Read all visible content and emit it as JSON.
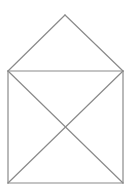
{
  "figure": {
    "stroke_color": "#8a8a8a",
    "background_color": "#ffffff",
    "vertices": {
      "apex": "roof apex",
      "top_left": "top-left corner of square",
      "top_right": "top-right corner of square",
      "bottom_left": "bottom-left corner of square",
      "bottom_right": "bottom-right corner of square"
    },
    "edges": [
      {
        "name": "roof-left-edge",
        "from": "apex",
        "to": "top_left"
      },
      {
        "name": "roof-right-edge",
        "from": "apex",
        "to": "top_right"
      },
      {
        "name": "square-top-edge",
        "from": "top_left",
        "to": "top_right"
      },
      {
        "name": "square-left-edge",
        "from": "top_left",
        "to": "bottom_left"
      },
      {
        "name": "square-right-edge",
        "from": "top_right",
        "to": "bottom_right"
      },
      {
        "name": "square-bottom-edge",
        "from": "bottom_left",
        "to": "bottom_right"
      },
      {
        "name": "diagonal-tl-br",
        "from": "top_left",
        "to": "bottom_right"
      },
      {
        "name": "diagonal-tr-bl",
        "from": "top_right",
        "to": "bottom_left"
      }
    ]
  }
}
